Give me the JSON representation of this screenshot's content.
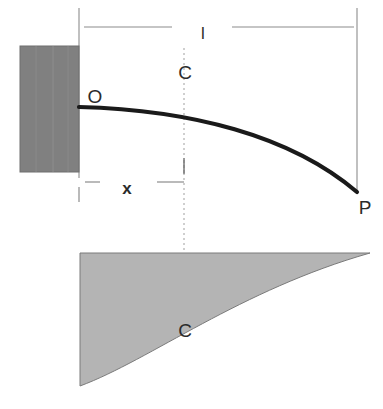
{
  "figure": {
    "type": "engineering-diagram",
    "width": 383,
    "height": 409,
    "background_color": "#ffffff"
  },
  "colors": {
    "wall_fill": "#808080",
    "wall_stroke": "#6e6e6e",
    "shaded_region_fill": "#b4b4b4",
    "shaded_region_stroke": "#7a7a7a",
    "curve_color": "#1a1a1a",
    "dimension_line_color": "#8c8c8c",
    "centerline_color": "#a8a8a8",
    "text_color": "#2b2b2b"
  },
  "labels": {
    "length": "l",
    "distance": "x",
    "origin_point": "O",
    "end_point": "P",
    "centroid_top": "C",
    "centroid_bottom": "C"
  },
  "label_positions": {
    "length": {
      "x": 203,
      "y": 33
    },
    "distance": {
      "x": 127,
      "y": 188
    },
    "origin_point": {
      "x": 95,
      "y": 97
    },
    "end_point": {
      "x": 365,
      "y": 208
    },
    "centroid_top": {
      "x": 185,
      "y": 73
    },
    "centroid_bottom": {
      "x": 185,
      "y": 331
    }
  },
  "wall_support": {
    "name": "fixed-wall-support",
    "x": 20,
    "y": 46,
    "width": 59,
    "height": 126
  },
  "beam_curve": {
    "name": "deflected-beam-curve",
    "start": {
      "x": 79,
      "y": 107
    },
    "end": {
      "x": 357,
      "y": 192
    },
    "control_1": {
      "x": 190,
      "y": 110
    },
    "control_2": {
      "x": 290,
      "y": 135
    },
    "stroke_width": 4.2
  },
  "shaded_region": {
    "name": "bending-moment-area",
    "top_left": {
      "x": 80,
      "y": 253
    },
    "top_right": {
      "x": 370,
      "y": 253
    },
    "bottom_left": {
      "x": 80,
      "y": 386
    },
    "curve_control_1": {
      "x": 150,
      "y": 360
    },
    "curve_control_2": {
      "x": 240,
      "y": 290
    }
  },
  "dimensions": {
    "length_dim": {
      "name": "length-dimension-l",
      "y": 27,
      "left_extension_x": 79,
      "right_extension_x": 357,
      "extension_top_y": 8,
      "extension_bottom_y": 190,
      "left_segment": {
        "x1": 82,
        "x2": 172
      },
      "right_segment": {
        "x1": 232,
        "x2": 354
      }
    },
    "distance_dim": {
      "name": "distance-dimension-x",
      "y": 182,
      "left_segment": {
        "x1": 82,
        "x2": 100
      },
      "right_segment": {
        "x1": 157,
        "x2": 184
      },
      "left_tick": {
        "x": 79,
        "y1": 187,
        "y2": 202
      },
      "right_tick": {
        "x": 184,
        "y1": 158,
        "y2": 174
      }
    },
    "centerline": {
      "name": "centroid-centerline",
      "x": 184,
      "top_y": 48,
      "bottom_y": 332,
      "dash": "2 3"
    }
  }
}
